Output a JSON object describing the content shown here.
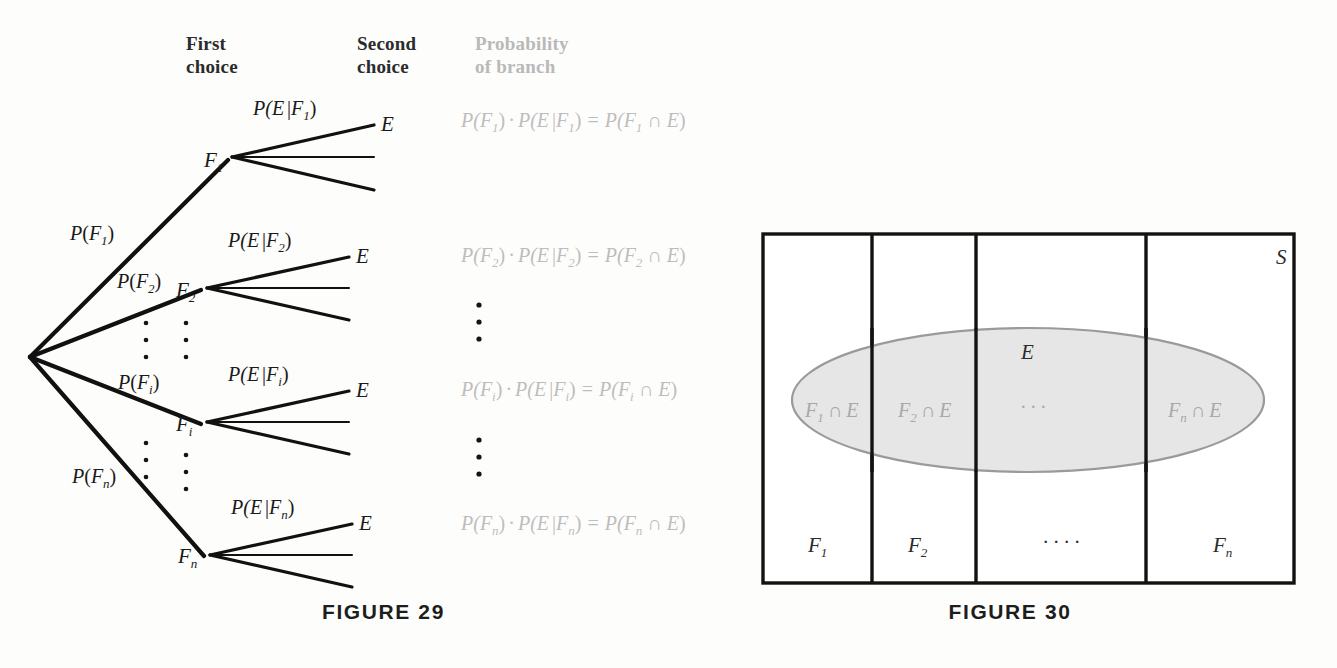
{
  "page": {
    "background": "#fdfdfc",
    "width": 1337,
    "height": 668
  },
  "colors": {
    "ink": "#111111",
    "gray_text": "#bdbdbd",
    "mid_gray": "#9a9a9a",
    "ellipse_fill": "#e6e6e6",
    "header_dark": "#2b2b2b",
    "header_gray": "#b9b9b9"
  },
  "figure29": {
    "caption": "FIGURE 29",
    "headers": [
      {
        "line1": "First",
        "line2": "choice",
        "tone": "dark"
      },
      {
        "line1": "Second",
        "line2": "choice",
        "tone": "dark"
      },
      {
        "line1": "Probability",
        "line2": "of branch",
        "tone": "gray"
      }
    ],
    "first_choice_branch_labels": [
      {
        "p": "P",
        "open": "(",
        "base": "F",
        "sub": "1",
        "close": ")"
      },
      {
        "p": "P",
        "open": "(",
        "base": "F",
        "sub": "2",
        "close": ")"
      },
      {
        "p": "P",
        "open": "(",
        "base": "F",
        "sub": "i",
        "close": ")"
      },
      {
        "p": "P",
        "open": "(",
        "base": "F",
        "sub": "n",
        "close": ")"
      }
    ],
    "nodes": [
      {
        "base": "F",
        "sub": "1"
      },
      {
        "base": "F",
        "sub": "2"
      },
      {
        "base": "F",
        "sub": "i"
      },
      {
        "base": "F",
        "sub": "n"
      }
    ],
    "second_choice_branch_labels": [
      {
        "text_prefix": "P(E",
        "bar": "|",
        "base": "F",
        "sub": "1",
        "close": ")"
      },
      {
        "text_prefix": "P(E",
        "bar": "|",
        "base": "F",
        "sub": "2",
        "close": ")"
      },
      {
        "text_prefix": "P(E",
        "bar": "|",
        "base": "F",
        "sub": "i",
        "close": ")"
      },
      {
        "text_prefix": "P(E",
        "bar": "|",
        "base": "F",
        "sub": "n",
        "close": ")"
      }
    ],
    "outcome_labels": [
      "E",
      "E",
      "E",
      "E"
    ],
    "branch_probability_rows": [
      {
        "a_p": "P(",
        "a_base": "F",
        "a_sub": "1",
        "a_close": ")",
        "dot": "·",
        "b_prefix": "P(E",
        "b_bar": "|",
        "b_base": "F",
        "b_sub": "1",
        "b_close": ")",
        "eq": "=",
        "c_open": "P(",
        "c_base": "F",
        "c_sub": "1",
        "cap": "∩",
        "c_e": "E",
        "c_close": ")"
      },
      {
        "a_p": "P(",
        "a_base": "F",
        "a_sub": "2",
        "a_close": ")",
        "dot": "·",
        "b_prefix": "P(E",
        "b_bar": "|",
        "b_base": "F",
        "b_sub": "2",
        "b_close": ")",
        "eq": "=",
        "c_open": "P(",
        "c_base": "F",
        "c_sub": "2",
        "cap": "∩",
        "c_e": "E",
        "c_close": ")"
      },
      {
        "a_p": "P(",
        "a_base": "F",
        "a_sub": "i",
        "a_close": ")",
        "dot": "·",
        "b_prefix": "P(E",
        "b_bar": "|",
        "b_base": "F",
        "b_sub": "i",
        "b_close": ")",
        "eq": "=",
        "c_open": "P(",
        "c_base": "F",
        "c_sub": "i",
        "cap": "∩",
        "c_e": "E",
        "c_close": ")"
      },
      {
        "a_p": "P(",
        "a_base": "F",
        "a_sub": "n",
        "a_close": ")",
        "dot": "·",
        "b_prefix": "P(E",
        "b_bar": "|",
        "b_base": "F",
        "b_sub": "n",
        "b_close": ")",
        "eq": "=",
        "c_open": "P(",
        "c_base": "F",
        "c_sub": "n",
        "cap": "∩",
        "c_e": "E",
        "c_close": ")"
      }
    ],
    "ellipsis_marks": "vertical-three-dots"
  },
  "figure30": {
    "caption": "FIGURE 30",
    "sample_space_label": "S",
    "event_label": "E",
    "partition_labels": [
      {
        "base": "F",
        "sub": "1"
      },
      {
        "base": "F",
        "sub": "2"
      },
      {
        "dots": "· · · ·"
      },
      {
        "base": "F",
        "sub": "n"
      }
    ],
    "intersection_labels": [
      {
        "base": "F",
        "sub": "1",
        "cap": "∩",
        "e": "E"
      },
      {
        "base": "F",
        "sub": "2",
        "cap": "∩",
        "e": "E"
      },
      {
        "dots": "· · ·"
      },
      {
        "base": "F",
        "sub": "n",
        "cap": "∩",
        "e": "E"
      }
    ]
  }
}
